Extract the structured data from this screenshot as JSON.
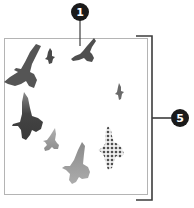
{
  "diagram": {
    "frame": {
      "x": 4,
      "y": 38,
      "width": 144,
      "height": 157,
      "stroke": "#b4b4b4"
    },
    "bracket": {
      "top_y": 36,
      "bottom_y": 199,
      "x": 152,
      "left_x": 136,
      "mid_y": 118,
      "stroke": "#3c3c3c"
    },
    "callouts": [
      {
        "id": "callout-1",
        "label": "1",
        "cx": 80,
        "cy": 12,
        "r": 9,
        "line_to_y": 46,
        "fill": "#1a1a1a"
      },
      {
        "id": "callout-5",
        "label": "5",
        "cx": 180,
        "cy": 118,
        "r": 9,
        "line_from_x": 152,
        "fill": "#1a1a1a"
      }
    ],
    "birds": [
      {
        "name": "large-dark-bird-top-left",
        "x": 22,
        "y": 64,
        "scale": 1.0,
        "color_top": "#555555",
        "color_bottom": "#4a4a4a"
      },
      {
        "name": "small-bird-top",
        "x": 50,
        "y": 56,
        "scale": 0.35,
        "color_top": "#4a4a4a",
        "color_bottom": "#4a4a4a"
      },
      {
        "name": "medium-bird-top-right-callout",
        "x": 82,
        "y": 50,
        "scale": 0.55,
        "color_top": "#4f4f4f",
        "color_bottom": "#4a4a4a"
      },
      {
        "name": "small-bird-right",
        "x": 119,
        "y": 92,
        "scale": 0.3,
        "color_top": "#6a6a6a",
        "color_bottom": "#6a6a6a"
      },
      {
        "name": "dark-bird-left-middle",
        "x": 28,
        "y": 120,
        "scale": 0.95,
        "color_top": "#8a8a8a",
        "color_bottom": "#3a3a3a"
      },
      {
        "name": "small-bird-lower-left",
        "x": 51,
        "y": 145,
        "scale": 0.55,
        "color_top": "#a8a8a8",
        "color_bottom": "#8e8e8e"
      },
      {
        "name": "large-light-bird-bottom",
        "x": 78,
        "y": 167,
        "scale": 0.9,
        "color_top": "#909090",
        "color_bottom": "#a8a8a8"
      },
      {
        "name": "patterned-bird-bottom-right",
        "x": 113,
        "y": 152,
        "scale": 0.85,
        "pattern": "dots",
        "color_top": "#555555",
        "color_bottom": "#555555"
      }
    ]
  }
}
